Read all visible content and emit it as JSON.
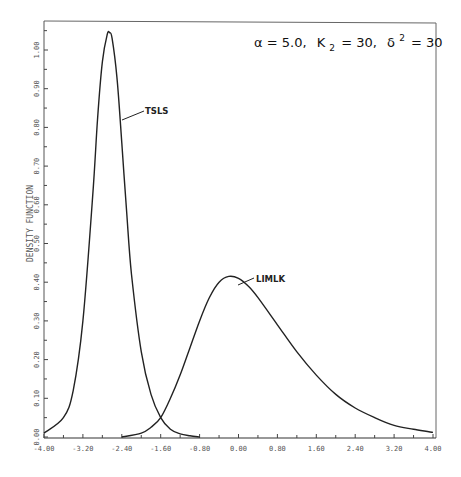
{
  "chart_data": {
    "type": "line",
    "title_parts": {
      "alpha": "α = 5.0,",
      "k": "K",
      "k_sub": "2",
      "k_val": "= 30,",
      "delta": "δ",
      "delta_sup": "2",
      "delta_val": "= 30"
    },
    "xlabel": "",
    "ylabel": "DENSITY FUNCTION",
    "xlim": [
      -4.0,
      4.0
    ],
    "ylim": [
      0.0,
      1.05
    ],
    "grid": false,
    "legend": "inline labels",
    "x_ticks": [
      "-4.00",
      "-3.20",
      "-2.40",
      "-1.60",
      "-0.80",
      "0.00",
      "0.80",
      "1.60",
      "2.40",
      "3.20",
      "4.00"
    ],
    "y_ticks": [
      "0.00",
      "0.10",
      "0.20",
      "0.30",
      "0.40",
      "0.50",
      "0.60",
      "0.70",
      "0.80",
      "0.90",
      "1.00"
    ],
    "series": [
      {
        "name": "TSLS",
        "x": [
          -4.0,
          -3.6,
          -3.4,
          -3.2,
          -3.0,
          -2.9,
          -2.8,
          -2.7,
          -2.65,
          -2.6,
          -2.5,
          -2.4,
          -2.3,
          -2.2,
          -2.0,
          -1.8,
          -1.6,
          -1.4,
          -1.2,
          -1.0,
          -0.8
        ],
        "values": [
          0.01,
          0.05,
          0.12,
          0.3,
          0.62,
          0.82,
          0.97,
          1.04,
          1.045,
          1.03,
          0.93,
          0.76,
          0.58,
          0.42,
          0.22,
          0.11,
          0.05,
          0.02,
          0.008,
          0.003,
          0.0
        ]
      },
      {
        "name": "LIMLK",
        "x": [
          -2.4,
          -2.0,
          -1.8,
          -1.6,
          -1.4,
          -1.2,
          -1.0,
          -0.8,
          -0.6,
          -0.4,
          -0.2,
          0.0,
          0.2,
          0.4,
          0.8,
          1.2,
          1.6,
          2.0,
          2.4,
          2.8,
          3.2,
          3.6,
          4.0
        ],
        "values": [
          0.0,
          0.01,
          0.025,
          0.05,
          0.1,
          0.16,
          0.23,
          0.3,
          0.36,
          0.4,
          0.415,
          0.41,
          0.39,
          0.36,
          0.29,
          0.22,
          0.16,
          0.11,
          0.075,
          0.05,
          0.03,
          0.02,
          0.012
        ]
      }
    ],
    "annotations": [
      {
        "text": "TSLS",
        "x": -2.2,
        "y": 0.85
      },
      {
        "text": "LIMLK",
        "x": 0.35,
        "y": 0.4
      }
    ]
  }
}
